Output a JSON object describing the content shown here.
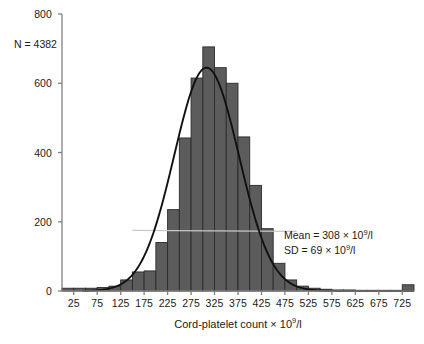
{
  "figure": {
    "background": "#ffffff",
    "bar_fill": "#5c5c5c",
    "bar_stroke": "#2b2b2b",
    "curve_color": "#111111",
    "axis_color": "#808080",
    "guide_color": "#c8c8c8"
  },
  "annotations": {
    "n_label": "N = 4382",
    "mean_label_prefix": "Mean = 308 × 10",
    "mean_label_exp": "9",
    "mean_label_suffix": "/l",
    "sd_label_prefix": "SD = 69 × 10",
    "sd_label_exp": "9",
    "sd_label_suffix": "/l"
  },
  "axis": {
    "xlabel_prefix": "Cord-platelet count × 10",
    "xlabel_exp": "9",
    "xlabel_suffix": "/l",
    "ylabel": ""
  },
  "chart_data": {
    "type": "bar",
    "title": "",
    "xlabel": "Cord-platelet count × 10^9/l",
    "ylabel": "",
    "xlim": [
      0,
      750
    ],
    "ylim": [
      0,
      800
    ],
    "xticks": [
      25,
      75,
      125,
      175,
      225,
      275,
      325,
      375,
      425,
      475,
      525,
      575,
      625,
      675,
      725
    ],
    "yticks": [
      0,
      200,
      400,
      600,
      800
    ],
    "grid": false,
    "legend": null,
    "bin_width": 25,
    "categories": [
      "0-25",
      "25-50",
      "50-75",
      "75-100",
      "100-125",
      "125-150",
      "150-175",
      "175-200",
      "200-225",
      "225-250",
      "250-275",
      "275-300",
      "300-325",
      "325-350",
      "350-375",
      "375-400",
      "400-425",
      "425-450",
      "450-475",
      "475-500",
      "500-525",
      "525-550",
      "550-575",
      "575-600",
      "600-625",
      "625-650",
      "650-675",
      "675-700",
      "700-725",
      "725-750"
    ],
    "bin_starts": [
      0,
      25,
      50,
      75,
      100,
      125,
      150,
      175,
      200,
      225,
      250,
      275,
      300,
      325,
      350,
      375,
      400,
      425,
      450,
      475,
      500,
      525,
      550,
      575,
      600,
      625,
      650,
      675,
      700,
      725
    ],
    "values": [
      8,
      8,
      8,
      10,
      14,
      32,
      55,
      58,
      140,
      235,
      442,
      615,
      705,
      645,
      600,
      445,
      305,
      180,
      80,
      32,
      14,
      8,
      5,
      3,
      3,
      2,
      2,
      2,
      2,
      18
    ],
    "series": [
      {
        "name": "Cord platelet count frequency",
        "values": [
          8,
          8,
          8,
          10,
          14,
          32,
          55,
          58,
          140,
          235,
          442,
          615,
          705,
          645,
          600,
          445,
          305,
          180,
          80,
          32,
          14,
          8,
          5,
          3,
          3,
          2,
          2,
          2,
          2,
          18
        ]
      }
    ],
    "overlay_curve": {
      "type": "normal-distribution",
      "mean": 308,
      "sd": 69,
      "peak_value": 645,
      "note": "Fitted normal curve overlaid on the histogram"
    },
    "statistics": {
      "n": 4382,
      "mean": 308,
      "sd": 69,
      "units": "10^9/l"
    }
  }
}
